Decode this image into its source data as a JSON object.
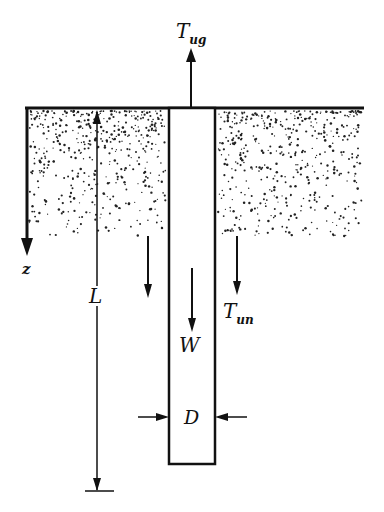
{
  "diagram": {
    "colors": {
      "ink": "#111111",
      "background": "#ffffff",
      "soil_dots": "#222222"
    },
    "labels": {
      "uplift_force_main": "T",
      "uplift_force_sub": "ug",
      "depth_axis": "z",
      "pile_length": "L",
      "pile_weight": "W",
      "skin_friction_main": "T",
      "skin_friction_sub": "un",
      "pile_diameter": "D"
    },
    "elements": [
      {
        "id": "ground-surface",
        "type": "line"
      },
      {
        "id": "soil",
        "type": "stippled-region"
      },
      {
        "id": "pile",
        "type": "rectangle"
      },
      {
        "id": "uplift-arrow",
        "label": "T_ug",
        "direction": "up"
      },
      {
        "id": "depth-arrow",
        "label": "z",
        "direction": "down"
      },
      {
        "id": "length-dimension",
        "label": "L"
      },
      {
        "id": "weight-arrow",
        "label": "W",
        "direction": "down"
      },
      {
        "id": "friction-arrows",
        "label": "T_un",
        "direction": "down",
        "count": 2
      },
      {
        "id": "diameter-dimension",
        "label": "D"
      }
    ]
  }
}
